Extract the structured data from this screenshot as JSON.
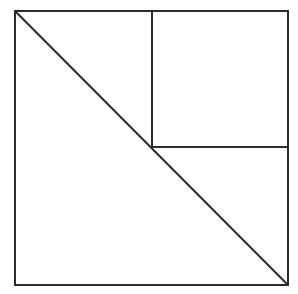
{
  "diagram": {
    "background": "#ffffff",
    "stroke_color": "#2b2b2b",
    "stroke_width": 2,
    "outer_square": {
      "x1": 15,
      "y1": 11,
      "x2": 288,
      "y2": 285
    },
    "inner_square": {
      "x1": 152,
      "y1": 11,
      "x2": 288,
      "y2": 147
    },
    "diagonal": {
      "x1": 15,
      "y1": 11,
      "x2": 288,
      "y2": 285
    },
    "shapes": [
      {
        "id": "outer-square",
        "type": "square"
      },
      {
        "id": "inner-square-top-right",
        "type": "square"
      },
      {
        "id": "diagonal-top-left-to-bottom-right",
        "type": "line"
      }
    ]
  }
}
